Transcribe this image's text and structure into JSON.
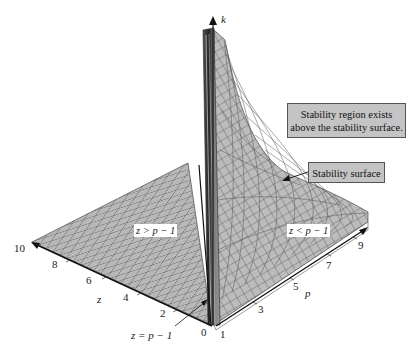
{
  "figure": {
    "title": "",
    "axes": {
      "k": {
        "label": "k"
      },
      "z": {
        "label": "z",
        "ticks": [
          "0",
          "2",
          "4",
          "6",
          "8",
          "10"
        ]
      },
      "p": {
        "label": "p",
        "ticks": [
          "1",
          "3",
          "5",
          "7",
          "9"
        ]
      }
    },
    "regions": {
      "left": "z > p − 1",
      "right": "z < p − 1"
    },
    "annotations": {
      "boundary": "z = p − 1",
      "stability_region_line1": "Stability region exists",
      "stability_region_line2": "above the stability surface.",
      "stability_surface": "Stability surface"
    },
    "colors": {
      "surface": "#b8b8b8",
      "surface_grid": "#4a4a4a",
      "spike": "#3a3a3a",
      "callout_bg": "#c4c4c4",
      "axis": "#111111"
    }
  }
}
